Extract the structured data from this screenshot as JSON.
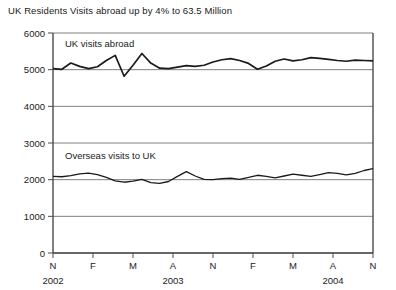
{
  "chart_data": {
    "type": "line",
    "title": "UK Residents Visits abroad up by 4% to 63.5 Million",
    "xlabel": "",
    "ylabel": "",
    "ylim": [
      0,
      6000
    ],
    "ytick_values": [
      0,
      1000,
      2000,
      3000,
      4000,
      5000,
      6000
    ],
    "ytick_labels": [
      "0",
      "1000",
      "2000",
      "3000",
      "4000",
      "5000",
      "6000"
    ],
    "xtick_labels": [
      "N",
      "F",
      "M",
      "A",
      "N",
      "F",
      "M",
      "A",
      "N"
    ],
    "year_labels": [
      "2002",
      "2003",
      "2004"
    ],
    "grid": true,
    "legend_position": "inline-annotation",
    "series": [
      {
        "name": "UK visits abroad",
        "label_x": 6,
        "label_y": 5620,
        "values": [
          5030,
          5010,
          5180,
          5090,
          5030,
          5080,
          5250,
          5390,
          4820,
          5120,
          5440,
          5180,
          5040,
          5030,
          5070,
          5110,
          5090,
          5120,
          5210,
          5270,
          5300,
          5250,
          5170,
          5010,
          5100,
          5230,
          5290,
          5240,
          5270,
          5330,
          5310,
          5280,
          5250,
          5230,
          5260,
          5250,
          5240
        ]
      },
      {
        "name": "Overseas visits to UK",
        "label_x": 6,
        "label_y": 2570,
        "values": [
          2090,
          2080,
          2110,
          2160,
          2180,
          2140,
          2060,
          1970,
          1930,
          1960,
          2010,
          1920,
          1900,
          1950,
          2090,
          2220,
          2100,
          2010,
          2000,
          2030,
          2040,
          2010,
          2060,
          2120,
          2090,
          2050,
          2100,
          2150,
          2120,
          2090,
          2140,
          2190,
          2170,
          2130,
          2170,
          2250,
          2300
        ]
      }
    ]
  },
  "colors": {
    "background": "#ffffff",
    "axis": "#4a4a4a",
    "grid": "#808080",
    "series_line": "#1a1a1a",
    "text": "#1a1a1a"
  }
}
